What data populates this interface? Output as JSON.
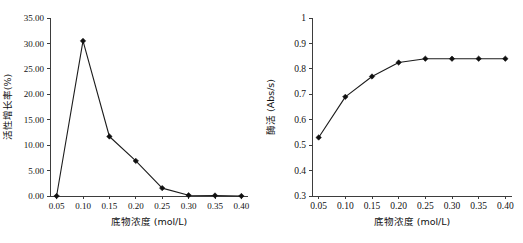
{
  "figure": {
    "panels": [
      "left",
      "right"
    ]
  },
  "chart_data": [
    {
      "type": "line",
      "panel": "left",
      "title": "",
      "xlabel": "底物浓度 (mol/L)",
      "ylabel": "活性增长率(%)",
      "x": [
        0.05,
        0.1,
        0.15,
        0.2,
        0.25,
        0.3,
        0.35,
        0.4
      ],
      "values": [
        0.0,
        30.5,
        11.7,
        6.9,
        1.55,
        0.15,
        0.1,
        0.0
      ],
      "xtick_labels": [
        "0.05",
        "0.10",
        "0.15",
        "0.20",
        "0.25",
        "0.30",
        "0.35",
        "0.40"
      ],
      "ytick_labels": [
        "0.00",
        "5.00",
        "10.00",
        "15.00",
        "20.00",
        "25.00",
        "30.00",
        "35.00"
      ],
      "ytick_values": [
        0,
        5,
        10,
        15,
        20,
        25,
        30,
        35
      ],
      "xlim": [
        0.0375,
        0.4125
      ],
      "ylim": [
        0,
        35
      ],
      "grid": false,
      "legend": false,
      "marker": "diamond",
      "line_color": "#1c1c1c",
      "marker_color": "#101010"
    },
    {
      "type": "line",
      "panel": "right",
      "title": "",
      "xlabel": "底物浓度 (mol/L)",
      "ylabel": "酶活 (Abs/s)",
      "x": [
        0.05,
        0.1,
        0.15,
        0.2,
        0.25,
        0.3,
        0.35,
        0.4
      ],
      "values": [
        0.53,
        0.69,
        0.77,
        0.825,
        0.84,
        0.84,
        0.84,
        0.84
      ],
      "xtick_labels": [
        "0.05",
        "0.10",
        "0.15",
        "0.20",
        "0.25",
        "0.30",
        "0.35",
        "0.40"
      ],
      "ytick_labels": [
        "0.3",
        "0.4",
        "0.5",
        "0.6",
        "0.7",
        "0.8",
        "0.9",
        "1"
      ],
      "ytick_values": [
        0.3,
        0.4,
        0.5,
        0.6,
        0.7,
        0.8,
        0.9,
        1.0
      ],
      "xlim": [
        0.0375,
        0.4125
      ],
      "ylim": [
        0.3,
        1.0
      ],
      "grid": false,
      "legend": false,
      "marker": "diamond",
      "line_color": "#1c1c1c",
      "marker_color": "#101010"
    }
  ]
}
